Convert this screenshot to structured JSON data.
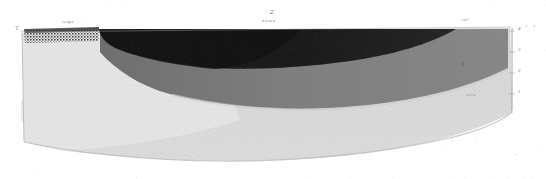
{
  "plate": {
    "title": "Geological cross-section plate",
    "width": 546,
    "height": 179,
    "background_color": "#ffffff",
    "medium": "engraved halftone scan, monochrome"
  },
  "labels": {
    "top_center_number": "2",
    "right_interior_number": "1",
    "left_edge_mark": "T",
    "top_left_script": "coupe",
    "top_center_script": "niveau",
    "top_right_script": "sol",
    "right_lower_script": "assise",
    "bottom_right_mark": "⌐"
  },
  "scale_ticks": {
    "right_axis_values": [
      "4",
      "3",
      "2",
      "1"
    ],
    "top_right_pair": [
      "⊤",
      "⊤"
    ],
    "orientation": "vertical, right margin"
  },
  "strata": [
    {
      "id": "topsoil-stipple",
      "name": "Upper stippled topsoil band",
      "color": "#3c3c3c",
      "pattern": "coarse stipple",
      "position": "upper left strip"
    },
    {
      "id": "dark-wedge",
      "name": "Dark tapering wedge stratum",
      "color": "#1c1c1c",
      "pattern": "solid dense tone",
      "position": "upper centre-left, tapering right"
    },
    {
      "id": "mid-gray-band",
      "name": "Medium grey stratum",
      "color": "#7e7e7e",
      "pattern": "fine horizontal ruling",
      "position": "upper centre-right, concave base"
    },
    {
      "id": "light-hatch-body",
      "name": "Light diagonally hatched body",
      "color": "#d8d8d8",
      "pattern": "fine diagonal hatch",
      "position": "lower main mass"
    },
    {
      "id": "pale-fill-left",
      "name": "Pale stippled fill",
      "color": "#e4e4e4",
      "pattern": "light stipple",
      "position": "lower left"
    }
  ],
  "colors": {
    "darkest": "#1c1c1c",
    "dark": "#2e2e2e",
    "mid": "#7e7e7e",
    "light_mid": "#a9a9a9",
    "light": "#d6d6d6",
    "palest": "#e8e8e8",
    "paper": "#ffffff",
    "ink_faint": "#8a8a90"
  }
}
